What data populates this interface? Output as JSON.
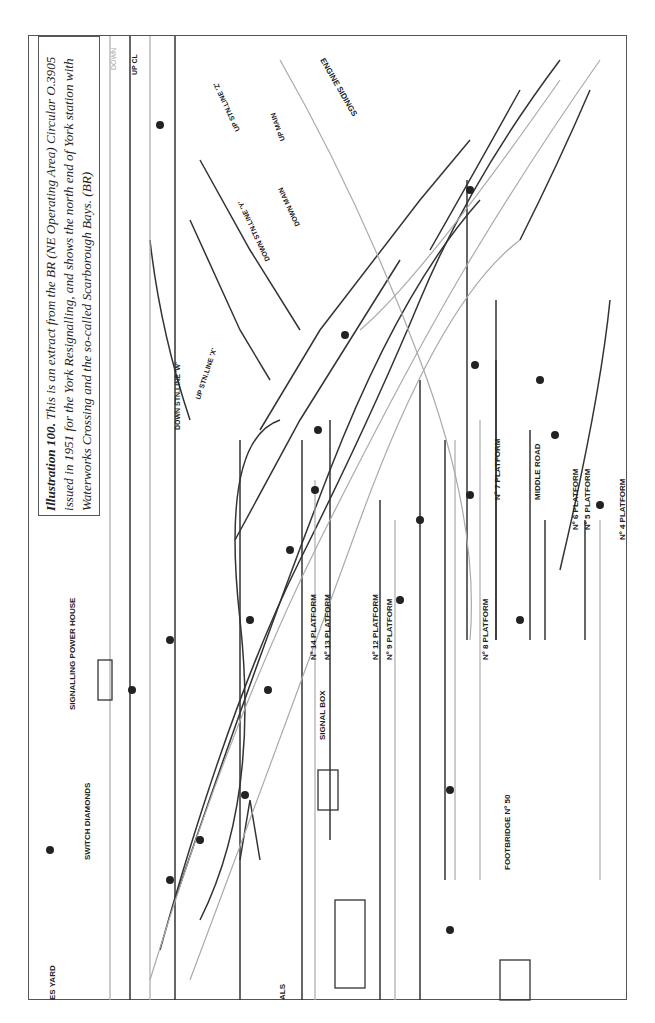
{
  "caption": {
    "title": "Illustration 100.",
    "text": "This is an extract from the BR (NE Operating Area) Circular O.3905 issued in 1951 for the York Resignalling, and shows the north end of York station with Waterworks Crossing and the so-called Scarborough Bays. (BR)"
  },
  "diagram": {
    "labels": {
      "signalling_power_house": "SIGNALLING POWER HOUSE",
      "switch_diamonds": "SWITCH DIAMONDS",
      "signal_box": "SIGNAL BOX",
      "footbridge": "FOOTBRIDGE Nº 50",
      "engine_sidings": "ENGINE SIDINGS",
      "yard": "ES YARD",
      "als": "ALS",
      "middle_road": "MIDDLE ROAD",
      "down_stn_line_w": "DOWN STN.LINE 'W'",
      "up_stn_line_x": "UP STN.LINE 'X'",
      "down_stn_line_y": "DOWN STN.LINE 'Y'",
      "up_stn_line_z": "UP STN.LINE 'Z'",
      "down_main": "DOWN MAIN",
      "up_main": "UP MAIN",
      "down": "DOWN",
      "up": "UP CL"
    },
    "platforms": [
      "Nº 14 PLATFORM",
      "Nº 13 PLATFORM",
      "Nº 12 PLATFORM",
      "Nº 9 PLATFORM",
      "Nº 8 PLATFORM",
      "Nº 7 PLATFORM",
      "Nº 6 PLATFORM",
      "Nº 5 PLATFORM",
      "Nº 4 PLATFORM"
    ],
    "track_circuits": [
      "224T",
      "234T",
      "223T",
      "235T",
      "236T",
      "237T",
      "241T",
      "243T",
      "244T",
      "245T",
      "262T",
      "263T",
      "264T",
      "265T",
      "267T",
      "270T",
      "271T",
      "272T",
      "275T",
      "277T",
      "279T",
      "281T",
      "282T",
      "283T",
      "284T",
      "286T",
      "287T",
      "288T",
      "289T",
      "312T",
      "313T",
      "315T",
      "316T",
      "317T",
      "318T",
      "319T",
      "320T",
      "369T",
      "370T",
      "371T",
      "372T",
      "373T",
      "374T",
      "375T",
      "378T",
      "379T",
      "380T",
      "381T",
      "382T",
      "383T",
      "232T",
      "233T",
      "247T",
      "248T",
      "257T",
      "258T",
      "164T"
    ],
    "signals": [
      "128",
      "130",
      "131",
      "132",
      "133",
      "135",
      "136",
      "137",
      "138",
      "139",
      "140",
      "141",
      "142",
      "143",
      "144",
      "145",
      "146",
      "147",
      "148",
      "150",
      "151",
      "153",
      "154",
      "155",
      "157",
      "160",
      "161",
      "162",
      "163",
      "164",
      "165",
      "167",
      "168",
      "169",
      "170",
      "171",
      "172",
      "173",
      "174",
      "175",
      "176",
      "177",
      "178",
      "179",
      "181",
      "182",
      "183",
      "184",
      "187",
      "189",
      "192",
      "193",
      "194",
      "225",
      "226",
      "227",
      "228",
      "229",
      "230",
      "231",
      "232",
      "233",
      "234",
      "235",
      "236",
      "237"
    ],
    "points": [
      "500",
      "501",
      "502",
      "503",
      "504",
      "505",
      "506",
      "507",
      "508",
      "509",
      "510",
      "511",
      "512",
      "513",
      "514",
      "515",
      "516",
      "517",
      "518",
      "521",
      "522",
      "523",
      "524",
      "525",
      "526",
      "528",
      "529",
      "530",
      "531",
      "532",
      "533",
      "535",
      "536",
      "556",
      "557",
      "558",
      "559",
      "560",
      "561",
      "562",
      "563",
      "564",
      "565",
      "566"
    ]
  }
}
